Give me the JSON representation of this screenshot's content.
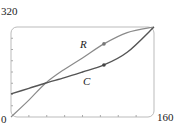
{
  "chart_data": {
    "type": "line",
    "title": "",
    "xlabel": "",
    "ylabel": "",
    "xlim": [
      0,
      160
    ],
    "ylim": [
      0,
      320
    ],
    "tick_labels": {
      "x_min": "0",
      "x_max": "160",
      "y_max": "320"
    },
    "x_ticks": [
      20,
      40,
      60,
      80,
      100,
      120,
      140
    ],
    "y_ticks": [
      40,
      80,
      120,
      160,
      200,
      240,
      280
    ],
    "grid": false,
    "series": [
      {
        "name": "R",
        "color": "#888888",
        "x": [
          0,
          20,
          39,
          60,
          80,
          104,
          130,
          160
        ],
        "y": [
          0,
          60,
          121,
          170,
          210,
          260,
          300,
          320
        ],
        "marker": {
          "x": 104,
          "y": 260
        }
      },
      {
        "name": "C",
        "color": "#555555",
        "x": [
          0,
          20,
          39,
          60,
          80,
          104,
          130,
          160
        ],
        "y": [
          82,
          102,
          121,
          140,
          160,
          185,
          230,
          320
        ],
        "marker": {
          "x": 104,
          "y": 185
        }
      }
    ]
  },
  "labels": {
    "y_max": "320",
    "origin": "0",
    "x_max": "160",
    "R": "R",
    "C": "C"
  }
}
